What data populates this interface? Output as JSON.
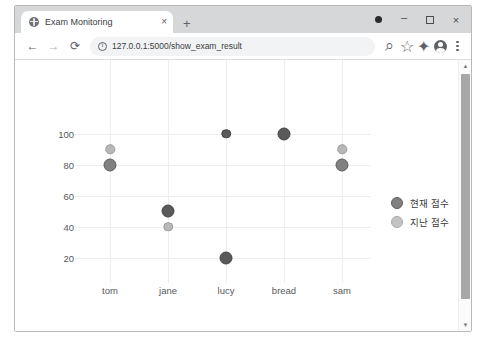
{
  "window": {
    "minimize_label": "–",
    "maximize_label": "",
    "close_label": "×"
  },
  "tab": {
    "title": "Exam Monitoring",
    "close_label": "×",
    "new_tab_label": "+",
    "favicon_name": "globe-icon"
  },
  "toolbar": {
    "back_label": "←",
    "forward_label": "→",
    "reload_label": "⟳",
    "zoom_label": "⌕",
    "bookmark_label": "☆",
    "extensions_label": "✦",
    "menu_label": "⋮"
  },
  "omnibox": {
    "url": "127.0.0.1:5000/show_exam_result",
    "placeholder": "Search Google or type a URL",
    "site_info_icon": "info-circle-icon"
  },
  "figure_toolbar": {
    "zoom_icon": "⌕",
    "pan_icon": "✚",
    "home_icon": "⌂",
    "config_icon": "☰",
    "save_icon": "⬚"
  },
  "scrollbar": {
    "up_arrow": "▲",
    "down_arrow": "▼"
  },
  "chart_data": {
    "type": "scatter",
    "title": "",
    "xlabel": "",
    "ylabel": "",
    "categories": [
      "tom",
      "jane",
      "lucy",
      "bread",
      "sam"
    ],
    "yticks": [
      20,
      40,
      60,
      80,
      100
    ],
    "ylim": [
      10,
      110
    ],
    "grid": true,
    "legend_position": "right",
    "series": [
      {
        "name": "현재 점수",
        "values": [
          80,
          50,
          20,
          100,
          80
        ],
        "color": "#808080",
        "marker_size": "large"
      },
      {
        "name": "지난 점수",
        "values": [
          90,
          40,
          100,
          100,
          90
        ],
        "color": "#b8b8b8",
        "marker_size": "small"
      }
    ]
  }
}
